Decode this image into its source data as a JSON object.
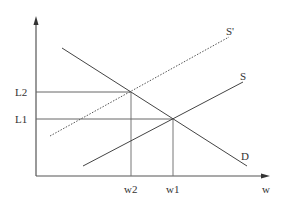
{
  "diagram": {
    "type": "supply-demand",
    "colors": {
      "line": "#555555",
      "guide": "#777777",
      "text": "#333333",
      "background": "#ffffff"
    },
    "axes": {
      "x_label": "w",
      "y_label": ""
    },
    "curves": {
      "demand": {
        "label": "D",
        "style": "solid"
      },
      "supply": {
        "label": "S",
        "style": "solid"
      },
      "supply_shifted": {
        "label": "S'",
        "style": "dotted"
      }
    },
    "levels": {
      "L1": {
        "label": "L1"
      },
      "L2": {
        "label": "L2"
      }
    },
    "wages": {
      "w1": {
        "label": "w1"
      },
      "w2": {
        "label": "w2"
      }
    }
  }
}
